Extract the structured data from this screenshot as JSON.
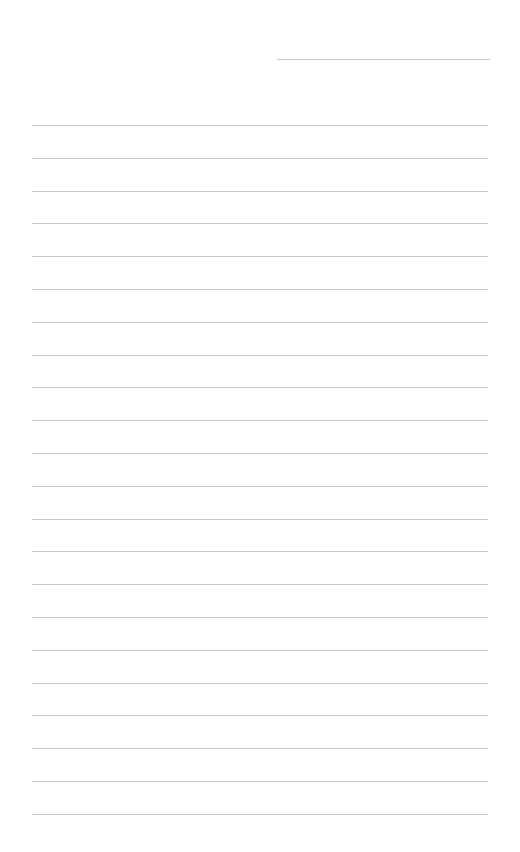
{
  "document": {
    "type": "lined-paper",
    "background_color": "#ffffff",
    "line_color": "#c8c8c8",
    "header": {
      "label": "",
      "line": {
        "x": 277,
        "y": 59,
        "width": 213
      }
    },
    "ruled_lines": {
      "count": 22,
      "x": 32,
      "width": 456,
      "first_y": 125,
      "spacing": 32.8
    }
  }
}
